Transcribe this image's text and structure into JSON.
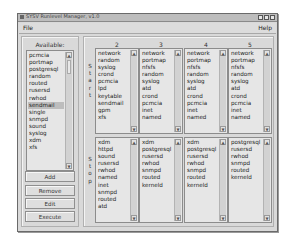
{
  "window": {
    "title": "SYSV Runlevel Manager, v1.0",
    "buttons": [
      "minimize",
      "maximize",
      "close"
    ]
  },
  "menu": {
    "file": "File",
    "help": "Help"
  },
  "available": {
    "label": "Available:",
    "items": [
      "pcmcia",
      "portmap",
      "postgresql",
      "random",
      "routed",
      "rusersd",
      "rwhod",
      "sendmail",
      "single",
      "snmpd",
      "sound",
      "syslog",
      "xdm",
      "xfs"
    ],
    "selected": "sendmail"
  },
  "buttons": {
    "add": "Add",
    "remove": "Remove",
    "edit": "Edit",
    "execute": "Execute"
  },
  "vertical_labels": {
    "start": [
      "S",
      "t",
      "a",
      "r",
      "t"
    ],
    "stop": [
      "S",
      "t",
      "o",
      "p"
    ]
  },
  "runlevels": [
    {
      "label": "2",
      "start": [
        "network",
        "random",
        "syslog",
        "crond",
        "pcmcia",
        "lpd",
        "keytable",
        "sendmail",
        "gpm",
        "xfs"
      ],
      "stop": [
        "xdm",
        "httpd",
        "sound",
        "rusersd",
        "rwhod",
        "named",
        "inet",
        "snmpd",
        "routed",
        "atd"
      ]
    },
    {
      "label": "3",
      "start": [
        "network",
        "portmap",
        "nfsfs",
        "random",
        "syslog",
        "atd",
        "crond",
        "pcmcia",
        "inet",
        "named"
      ],
      "stop": [
        "xdm",
        "postgresql",
        "rusersd",
        "rwhod",
        "snmpd",
        "routed",
        "kerneld"
      ]
    },
    {
      "label": "4",
      "start": [
        "network",
        "portmap",
        "nfsfs",
        "random",
        "syslog",
        "atd",
        "crond",
        "pcmcia",
        "inet",
        "named"
      ],
      "stop": [
        "xdm",
        "postgresql",
        "rusersd",
        "rwhod",
        "snmpd",
        "routed",
        "kerneld"
      ]
    },
    {
      "label": "5",
      "start": [
        "network",
        "portmap",
        "nfsfs",
        "random",
        "syslog",
        "atd",
        "crond",
        "pcmcia",
        "inet",
        "named"
      ],
      "stop": [
        "postgresql",
        "rusersd",
        "rwhod",
        "snmpd",
        "routed",
        "kerneld"
      ]
    }
  ]
}
